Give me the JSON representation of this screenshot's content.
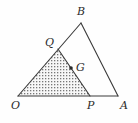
{
  "figure": {
    "background_color": "#fefefe",
    "stroke_color": "#3a3a3a",
    "shade_dot_color": "#6b6b6b",
    "shade_fill_color": "#f2f2f2",
    "label_color": "#2b2b2b",
    "width": 138,
    "height": 123
  },
  "points": {
    "O": {
      "label": "O",
      "x": 18,
      "y": 96,
      "label_x": 11,
      "label_y": 100
    },
    "A": {
      "label": "A",
      "x": 118,
      "y": 96,
      "label_x": 120,
      "label_y": 100
    },
    "B": {
      "label": "B",
      "x": 81,
      "y": 23,
      "label_x": 77,
      "label_y": 6
    },
    "P": {
      "label": "P",
      "x": 90,
      "y": 96,
      "label_x": 87,
      "label_y": 100
    },
    "Q": {
      "label": "Q",
      "x": 58,
      "y": 49,
      "label_x": 45,
      "label_y": 37
    },
    "G": {
      "label": "G",
      "x": 71,
      "y": 68,
      "label_x": 76,
      "label_y": 62
    }
  },
  "segments": [
    {
      "name": "side-OB",
      "from": "O",
      "to": "B"
    },
    {
      "name": "side-BA",
      "from": "B",
      "to": "A"
    },
    {
      "name": "side-OA",
      "from": "O",
      "to": "A"
    },
    {
      "name": "segment-QP",
      "from": "Q",
      "to": "P"
    }
  ],
  "shaded_region": {
    "name": "triangle-OQP",
    "vertices": [
      "O",
      "Q",
      "P"
    ],
    "pattern": "dotted"
  },
  "marked_points": [
    "G"
  ]
}
